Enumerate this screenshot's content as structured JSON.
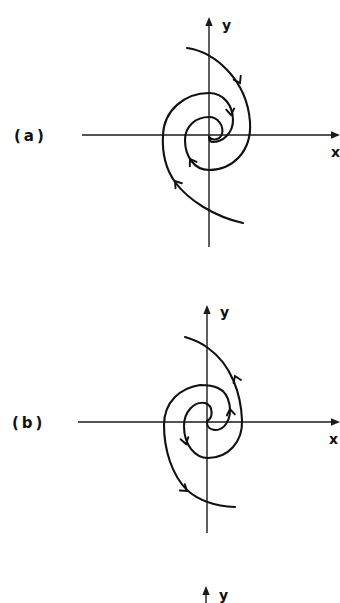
{
  "figure": {
    "background": "#ffffff",
    "ink_color": "#111111",
    "panels": [
      {
        "label": "(a)",
        "x_axis_label": "x",
        "y_axis_label": "y",
        "trajectory_count": 2,
        "rotation": "clockwise",
        "trajectory_direction": "inward"
      },
      {
        "label": "(b)",
        "x_axis_label": "x",
        "y_axis_label": "y",
        "trajectory_count": 2,
        "rotation": "counterclockwise",
        "trajectory_direction": "outward"
      },
      {
        "label": "",
        "y_axis_label": "y"
      }
    ]
  }
}
